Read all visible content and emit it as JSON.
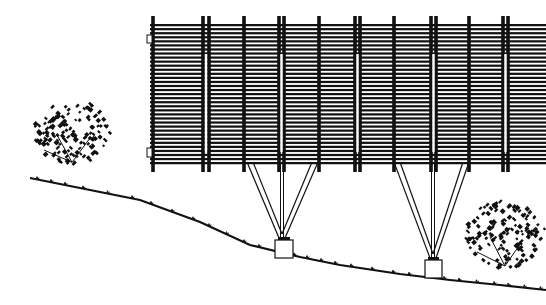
{
  "drawing": {
    "title": "Elevation of slatted canopy structure on sloped terrain",
    "background_color": "#ffffff",
    "ink_color": "#111111",
    "canopy": {
      "left": 150,
      "right": 546,
      "top": 24,
      "bottom": 162,
      "slat_count": 34,
      "posts": [
        {
          "type": "single",
          "x": [
            153
          ]
        },
        {
          "type": "double",
          "x": [
            203,
            209
          ]
        },
        {
          "type": "single",
          "x": [
            244
          ]
        },
        {
          "type": "double",
          "x": [
            279,
            284
          ]
        },
        {
          "type": "single",
          "x": [
            319
          ]
        },
        {
          "type": "double",
          "x": [
            355,
            360
          ]
        },
        {
          "type": "single",
          "x": [
            394
          ]
        },
        {
          "type": "double",
          "x": [
            431,
            436
          ]
        },
        {
          "type": "single",
          "x": [
            469
          ]
        },
        {
          "type": "double",
          "x": [
            503,
            508
          ]
        }
      ]
    },
    "supports": [
      {
        "name": "left-v-support",
        "top_left": 247,
        "top_right": 318,
        "apex_x": 282,
        "apex_y": 238,
        "footing": {
          "x": 275,
          "y": 240,
          "w": 18,
          "h": 18
        }
      },
      {
        "name": "right-v-support",
        "top_left": 394,
        "top_right": 469,
        "apex_x": 433,
        "apex_y": 258,
        "footing": {
          "x": 425,
          "y": 260,
          "w": 17,
          "h": 18
        }
      }
    ],
    "ground_line": [
      [
        30,
        178
      ],
      [
        70,
        186
      ],
      [
        140,
        200
      ],
      [
        200,
        222
      ],
      [
        250,
        245
      ],
      [
        300,
        257
      ],
      [
        340,
        265
      ],
      [
        400,
        274
      ],
      [
        450,
        280
      ],
      [
        500,
        285
      ],
      [
        546,
        290
      ]
    ],
    "trees": [
      {
        "name": "left-tree",
        "cx": 72,
        "cy": 130,
        "r": 38
      },
      {
        "name": "right-tree",
        "cx": 505,
        "cy": 232,
        "r": 40
      }
    ]
  }
}
